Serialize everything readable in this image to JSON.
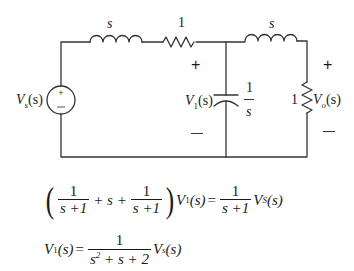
{
  "circuit": {
    "source": {
      "label": "V",
      "sub": "s",
      "arg": "(s)",
      "plus": "+",
      "minus": "−"
    },
    "inductor1": {
      "label": "s"
    },
    "resistor1": {
      "label": "1"
    },
    "inductor2": {
      "label": "s"
    },
    "capacitor": {
      "impedance_num": "1",
      "impedance_den": "s",
      "voltage_label": "V",
      "voltage_sub": "1",
      "voltage_arg": "(s)"
    },
    "resistor2": {
      "label": "1",
      "voltage_label": "V",
      "voltage_sub": "o",
      "voltage_arg": "(s)"
    },
    "node1_polarity": {
      "plus": "+",
      "minus": "—"
    },
    "output_polarity": {
      "plus": "+",
      "minus": "—"
    }
  },
  "equations": [
    {
      "text": "(1/(s+1) + s + 1/(s+1)) V1(s) = 1/(s+1) VS(s)",
      "term1_num": "1",
      "term1_den": "s +1",
      "plus1": "+ s +",
      "term2_num": "1",
      "term2_den": "s +1",
      "lhs_var": "V",
      "lhs_sub": "1",
      "lhs_arg": "(s)",
      "equals": "=",
      "rhs_num": "1",
      "rhs_den": "s +1",
      "rhs_var": "V",
      "rhs_sub": "S",
      "rhs_arg": "(s)"
    },
    {
      "text": "V1(s) = 1/(s^2+s+2) Vs(s)",
      "lhs_var": "V",
      "lhs_sub": "1",
      "lhs_arg": "(s)",
      "equals": "=",
      "rhs_num": "1",
      "rhs_den_a": "s",
      "rhs_den_exp": "2",
      "rhs_den_b": " + s + 2",
      "rhs_var": "V",
      "rhs_sub": "s",
      "rhs_arg": "(s)"
    }
  ]
}
